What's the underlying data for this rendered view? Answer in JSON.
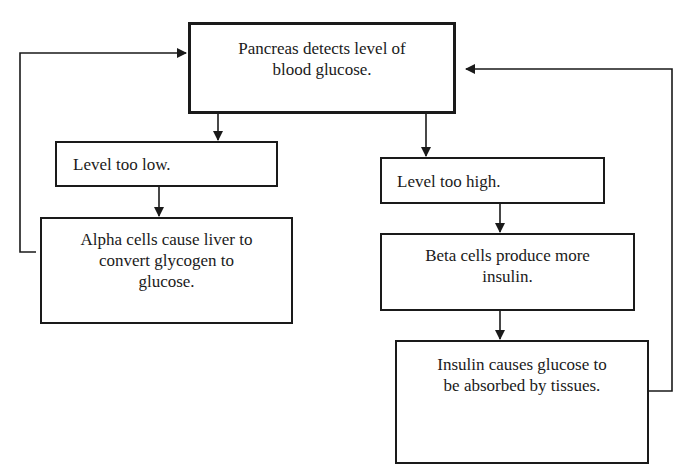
{
  "diagram": {
    "type": "flowchart",
    "title": "",
    "nodes": [
      {
        "id": "detect",
        "label": "Pancreas detects level of\nblood glucose."
      },
      {
        "id": "low",
        "label": "Level too low."
      },
      {
        "id": "alpha",
        "label": "Alpha cells cause liver to\nconvert glycogen to\nglucose."
      },
      {
        "id": "high",
        "label": "Level too high."
      },
      {
        "id": "beta",
        "label": "Beta cells produce more\ninsulin."
      },
      {
        "id": "insulin",
        "label": "Insulin causes glucose to\nbe absorbed by tissues."
      }
    ],
    "edges": [
      {
        "from": "detect",
        "to": "low"
      },
      {
        "from": "detect",
        "to": "high"
      },
      {
        "from": "low",
        "to": "alpha"
      },
      {
        "from": "high",
        "to": "beta"
      },
      {
        "from": "beta",
        "to": "insulin"
      },
      {
        "from": "alpha",
        "to": "detect",
        "kind": "feedback"
      },
      {
        "from": "insulin",
        "to": "detect",
        "kind": "feedback"
      }
    ],
    "colors": {
      "stroke": "#1a1a1a",
      "background": "#ffffff",
      "text": "#1a1a1a"
    }
  }
}
